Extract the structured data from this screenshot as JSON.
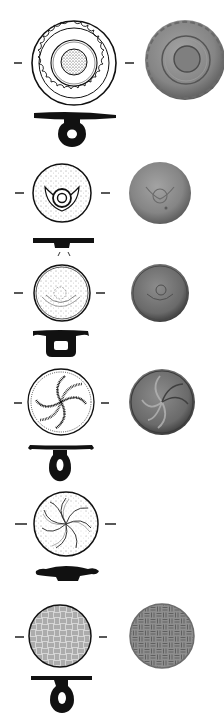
{
  "plate": {
    "width": 224,
    "height": 725,
    "background": "#ffffff",
    "ink_color": "#111111",
    "photo_base_color": "#7a7a7a"
  },
  "items": [
    {
      "id": 1,
      "motif": "concentric-rings-with-scalloped-border",
      "drawing": {
        "cx": 74,
        "cy": 63,
        "r": 42
      },
      "photo": {
        "cx": 185,
        "cy": 60,
        "r": 40,
        "shade": "#8c8c8c"
      },
      "axis_marks": [
        {
          "x1": 14,
          "x2": 22,
          "y": 63
        },
        {
          "x1": 125,
          "x2": 134,
          "y": 63
        }
      ],
      "profile": {
        "type": "bar-with-loop",
        "bar_y": 116,
        "bar_x1": 34,
        "bar_x2": 116,
        "loop_cx": 72,
        "loop_cy": 134
      }
    },
    {
      "id": 2,
      "motif": "stippled-with-central-rings-and-lunula",
      "drawing": {
        "cx": 62,
        "cy": 193,
        "r": 29
      },
      "photo": {
        "cx": 160,
        "cy": 193,
        "r": 31,
        "shade": "#8a8a8a"
      },
      "axis_marks": [
        {
          "x1": 15,
          "x2": 24,
          "y": 193
        },
        {
          "x1": 101,
          "x2": 110,
          "y": 193
        }
      ],
      "profile": {
        "type": "bar-with-stub",
        "bar_y": 241,
        "bar_x1": 33,
        "bar_x2": 94
      }
    },
    {
      "id": 3,
      "motif": "stippled-faint-concentric-arcs",
      "drawing": {
        "cx": 62,
        "cy": 293,
        "r": 28
      },
      "photo": {
        "cx": 160,
        "cy": 293,
        "r": 29,
        "shade": "#6e6e6e"
      },
      "axis_marks": [
        {
          "x1": 14,
          "x2": 23,
          "y": 293
        },
        {
          "x1": 96,
          "x2": 105,
          "y": 293
        }
      ],
      "profile": {
        "type": "shank-with-loop",
        "bar_y": 335,
        "bar_x1": 33,
        "bar_x2": 88,
        "loop_cx": 62,
        "loop_cy": 350
      }
    },
    {
      "id": 4,
      "motif": "whirl-rosette-hatched",
      "drawing": {
        "cx": 61,
        "cy": 402,
        "r": 33
      },
      "photo": {
        "cx": 162,
        "cy": 402,
        "r": 33,
        "shade": "#6a6a6a"
      },
      "axis_marks": [
        {
          "x1": 14,
          "x2": 22,
          "y": 403
        },
        {
          "x1": 101,
          "x2": 109,
          "y": 403
        }
      ],
      "profile": {
        "type": "bar-with-loop",
        "bar_y": 448,
        "bar_x1": 30,
        "bar_x2": 92,
        "loop_cx": 60,
        "loop_cy": 468
      }
    },
    {
      "id": 5,
      "motif": "whirl-rosette-stippled",
      "drawing": {
        "cx": 66,
        "cy": 524,
        "r": 32
      },
      "photo": null,
      "axis_marks": [
        {
          "x1": 15,
          "x2": 27,
          "y": 524
        },
        {
          "x1": 105,
          "x2": 116,
          "y": 524
        }
      ],
      "profile": {
        "type": "lens-with-knob",
        "bar_y": 572,
        "bar_x1": 36,
        "bar_x2": 99
      }
    },
    {
      "id": 6,
      "motif": "basketweave",
      "drawing": {
        "cx": 60,
        "cy": 636,
        "r": 31
      },
      "photo": {
        "cx": 162,
        "cy": 636,
        "r": 32,
        "shade": "#8e8e8e"
      },
      "axis_marks": [
        {
          "x1": 15,
          "x2": 24,
          "y": 637
        },
        {
          "x1": 99,
          "x2": 107,
          "y": 637
        }
      ],
      "profile": {
        "type": "bar-with-loop",
        "bar_y": 678,
        "bar_x1": 31,
        "bar_x2": 92,
        "loop_cx": 62,
        "loop_cy": 700
      }
    }
  ]
}
